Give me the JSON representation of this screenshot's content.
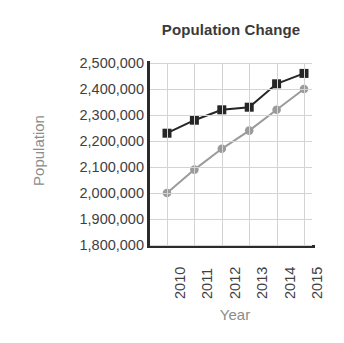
{
  "chart_data": {
    "type": "line",
    "title": "Population Change",
    "xlabel": "Year",
    "ylabel": "Population",
    "categories": [
      "2010",
      "2011",
      "2012",
      "2013",
      "2014",
      "2015"
    ],
    "x": [
      2010,
      2011,
      2012,
      2013,
      2014,
      2015
    ],
    "ylim": [
      1800000,
      2500000
    ],
    "ytick_step": 100000,
    "ytick_labels": [
      "2,500,000",
      "2,400,000",
      "2,300,000",
      "2,200,000",
      "2,100,000",
      "2,000,000",
      "1,900,000",
      "1,800,000"
    ],
    "ytick_values": [
      2500000,
      2400000,
      2300000,
      2200000,
      2100000,
      2000000,
      1900000,
      1800000
    ],
    "grid": true,
    "legend": null,
    "legend_position": "none",
    "series": [
      {
        "name": "series-1",
        "color": "#262626",
        "marker": "square",
        "values": [
          2230000,
          2280000,
          2320000,
          2330000,
          2420000,
          2460000
        ]
      },
      {
        "name": "series-2",
        "color": "#9b9b9b",
        "marker": "circle",
        "values": [
          2000000,
          2090000,
          2170000,
          2240000,
          2320000,
          2400000
        ]
      }
    ],
    "colors": {
      "title": "#3a3a3a",
      "axis_title": "#8c8c8c",
      "tick_label": "#3f3f3f",
      "grid": "#d3d3d3",
      "axis": "#2b2b2b",
      "series_1": "#262626",
      "series_2": "#9b9b9b",
      "background": "#ffffff"
    }
  }
}
